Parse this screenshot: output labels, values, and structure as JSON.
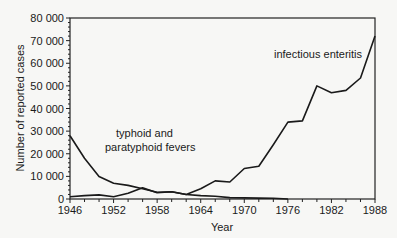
{
  "chart_data": {
    "type": "line",
    "title": "",
    "xlabel": "Year",
    "ylabel": "Number of reported cases",
    "xlim": [
      1946,
      1988
    ],
    "ylim": [
      0,
      80000
    ],
    "grid": false,
    "legend": "inline annotations",
    "x_ticks": [
      "1946",
      "1952",
      "1958",
      "1964",
      "1970",
      "1976",
      "1982",
      "1988"
    ],
    "y_ticks": [
      "0",
      "10 000",
      "20 000",
      "30 000",
      "40 000",
      "50 000",
      "60 000",
      "70 000",
      "80 000"
    ],
    "series": [
      {
        "name": "infectious enteritis",
        "x": [
          1946,
          1948,
          1950,
          1952,
          1954,
          1956,
          1958,
          1960,
          1962,
          1964,
          1966,
          1968,
          1970,
          1972,
          1974,
          1976,
          1978,
          1980,
          1982,
          1984,
          1986,
          1988
        ],
        "values": [
          1000,
          1500,
          1800,
          1000,
          2500,
          5000,
          2800,
          3200,
          2000,
          4500,
          8000,
          7500,
          13500,
          14500,
          24000,
          34000,
          34500,
          50000,
          47000,
          48000,
          53500,
          72000
        ]
      },
      {
        "name": "typhoid and paratyphoid fevers",
        "x": [
          1946,
          1948,
          1950,
          1952,
          1954,
          1956,
          1958,
          1960,
          1962,
          1964,
          1966,
          1968,
          1970,
          1972,
          1974,
          1976
        ],
        "values": [
          28000,
          18000,
          10000,
          7000,
          6000,
          4500,
          3000,
          3200,
          2000,
          1500,
          1200,
          600,
          500,
          400,
          300,
          0
        ]
      }
    ],
    "annotations": [
      {
        "text": "infectious enteritis",
        "series": "infectious enteritis"
      },
      {
        "text_line1": "typhoid and",
        "text_line2": "paratyphoid fevers",
        "series": "typhoid and paratyphoid fevers"
      }
    ]
  }
}
